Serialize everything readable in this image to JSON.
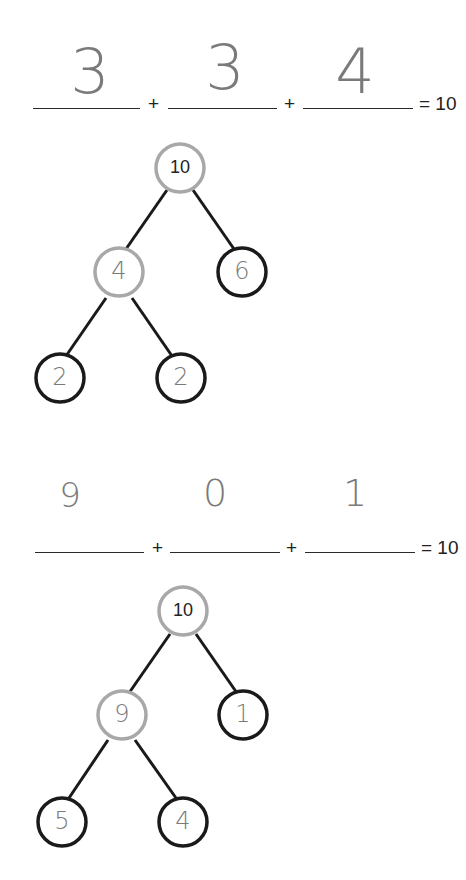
{
  "worksheet": {
    "problems": [
      {
        "equation": {
          "answers": [
            "3",
            "3",
            "4"
          ],
          "plus": "+",
          "equals": "= 10"
        },
        "tree": {
          "root": "10",
          "left": "4",
          "right": "6",
          "left_left": "2",
          "left_right": "2"
        }
      },
      {
        "equation": {
          "answers": [
            "9",
            "0",
            "1"
          ],
          "plus": "+",
          "equals": "= 10"
        },
        "tree": {
          "root": "10",
          "left": "9",
          "right": "1",
          "left_left": "5",
          "left_right": "4"
        }
      }
    ],
    "colors": {
      "given_node_stroke": "#a8a8a8",
      "answer_node_stroke": "#1a1a1a",
      "edge": "#1a1a1a",
      "handwriting": "#7a7a7a"
    }
  }
}
